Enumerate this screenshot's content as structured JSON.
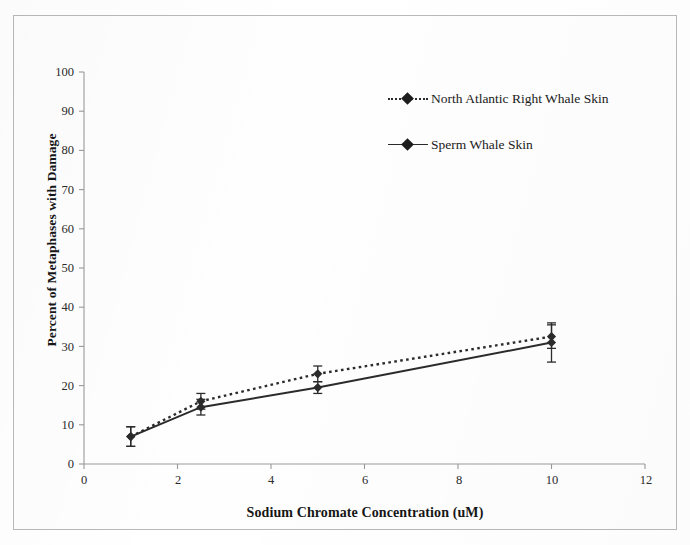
{
  "chart_data": {
    "type": "line",
    "title": "",
    "xlabel": "Sodium Chromate Concentration (uM)",
    "ylabel": "Percent of Metaphases with Damage",
    "xlim": [
      0,
      12
    ],
    "ylim": [
      0,
      100
    ],
    "xticks": [
      0,
      2,
      4,
      6,
      8,
      10,
      12
    ],
    "yticks": [
      0,
      10,
      20,
      30,
      40,
      50,
      60,
      70,
      80,
      90,
      100
    ],
    "grid": false,
    "legend_position": "upper right",
    "x": [
      1,
      2.5,
      5,
      10
    ],
    "series": [
      {
        "name": "North Atlantic Right Whale Skin",
        "linestyle": "dotted",
        "marker": "diamond",
        "color": "#2b2b2b",
        "values": [
          7,
          16,
          23,
          32.5
        ],
        "errors": [
          2.5,
          2,
          2,
          3
        ]
      },
      {
        "name": "Sperm Whale Skin",
        "linestyle": "solid",
        "marker": "diamond",
        "color": "#2b2b2b",
        "values": [
          7,
          14.5,
          19.5,
          31
        ],
        "errors": [
          2.5,
          2,
          1.5,
          5
        ]
      }
    ]
  },
  "axis": {
    "x_tick_labels": [
      "0",
      "2",
      "4",
      "6",
      "8",
      "10",
      "12"
    ],
    "y_tick_labels": [
      "0",
      "10",
      "20",
      "30",
      "40",
      "50",
      "60",
      "70",
      "80",
      "90",
      "100"
    ],
    "x_title": "Sodium Chromate Concentration (uM)",
    "y_title": "Percent of Metaphases with Damage"
  },
  "legend": {
    "entries": [
      {
        "label": "North Atlantic Right Whale Skin",
        "style": "dotted"
      },
      {
        "label": "Sperm Whale Skin",
        "style": "solid"
      }
    ]
  },
  "colors": {
    "ink": "#2b2b2b",
    "axis": "#9a9a9a",
    "frame": "#b9b9b9"
  }
}
